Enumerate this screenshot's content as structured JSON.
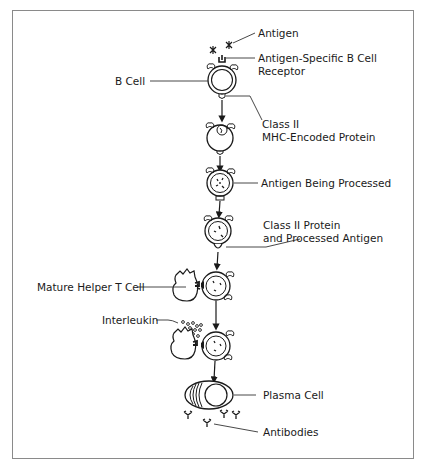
{
  "diagram": {
    "title": "",
    "stages": [
      {
        "id": "b-cell",
        "label": "B Cell"
      },
      {
        "id": "class2-mhc",
        "label": "Class II MHC-Encoded Protein"
      },
      {
        "id": "processing",
        "label": "Antigen Being Processed"
      },
      {
        "id": "presenting",
        "label": "Class II Protein and Processed Antigen"
      },
      {
        "id": "t-cell-binding",
        "label": "Mature Helper T Cell"
      },
      {
        "id": "interleukin",
        "label": "Interleukin"
      },
      {
        "id": "plasma",
        "label": "Plasma Cell"
      },
      {
        "id": "antibodies",
        "label": "Antibodies"
      }
    ],
    "labels": {
      "antigen": "Antigen",
      "receptor_line1": "Antigen-Specific B Cell",
      "receptor_line2": "Receptor",
      "b_cell": "B Cell",
      "class2_line1": "Class II",
      "class2_line2": "MHC-Encoded Protein",
      "processing": "Antigen Being Processed",
      "presenting_line1": "Class II Protein",
      "presenting_line2": "and Processed Antigen",
      "helper_t": "Mature Helper T Cell",
      "interleukin": "Interleukin",
      "plasma": "Plasma Cell",
      "antibodies": "Antibodies"
    },
    "colors": {
      "stroke": "#1a1a1a",
      "frame": "#8a8a8a",
      "leader": "#333333"
    }
  }
}
